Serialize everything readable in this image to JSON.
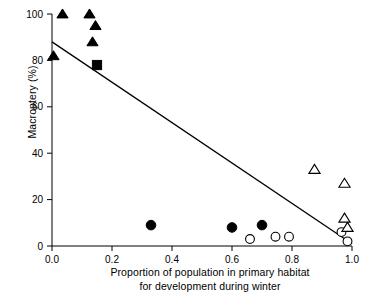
{
  "chart_data": {
    "type": "scatter",
    "title": "",
    "xlabel": "Proportion of population in primary habitat for development during winter",
    "xlabel_line1": "Proportion of population in primary habitat",
    "xlabel_line2": "for development during winter",
    "ylabel": "Macroptery (%)",
    "xlim": [
      0.0,
      1.0
    ],
    "ylim": [
      0,
      100
    ],
    "xticks": [
      0.0,
      0.2,
      0.4,
      0.6,
      0.8,
      1.0
    ],
    "xticklabels": [
      "0.0",
      "0.2",
      "0.4",
      "0.6",
      "0.8",
      "1.0"
    ],
    "yticks": [
      0,
      20,
      40,
      60,
      80,
      100
    ],
    "yticklabels": [
      "0",
      "20",
      "40",
      "60",
      "80",
      "100"
    ],
    "grid": false,
    "legend": "none",
    "series": [
      {
        "name": "filled-triangle",
        "marker": "triangle-filled",
        "color": "#000000",
        "points": [
          {
            "x": 0.005,
            "y": 82
          },
          {
            "x": 0.035,
            "y": 100
          },
          {
            "x": 0.125,
            "y": 100
          },
          {
            "x": 0.145,
            "y": 95
          },
          {
            "x": 0.135,
            "y": 88
          }
        ]
      },
      {
        "name": "filled-square",
        "marker": "square-filled",
        "color": "#000000",
        "points": [
          {
            "x": 0.15,
            "y": 78
          }
        ]
      },
      {
        "name": "filled-circle",
        "marker": "circle-filled",
        "color": "#000000",
        "points": [
          {
            "x": 0.33,
            "y": 9
          },
          {
            "x": 0.6,
            "y": 8
          },
          {
            "x": 0.7,
            "y": 9
          }
        ]
      },
      {
        "name": "open-circle",
        "marker": "circle-open",
        "color": "#000000",
        "points": [
          {
            "x": 0.66,
            "y": 3
          },
          {
            "x": 0.745,
            "y": 4
          },
          {
            "x": 0.79,
            "y": 4
          },
          {
            "x": 0.965,
            "y": 6
          },
          {
            "x": 0.985,
            "y": 2
          }
        ]
      },
      {
        "name": "open-triangle",
        "marker": "triangle-open",
        "color": "#000000",
        "points": [
          {
            "x": 0.875,
            "y": 33
          },
          {
            "x": 0.975,
            "y": 27
          },
          {
            "x": 0.975,
            "y": 12
          },
          {
            "x": 0.985,
            "y": 8
          }
        ]
      }
    ],
    "trendline": {
      "name": "regression-line",
      "x_start": 0.0,
      "y_start": 88,
      "x_end": 1.0,
      "y_end": 1
    }
  }
}
